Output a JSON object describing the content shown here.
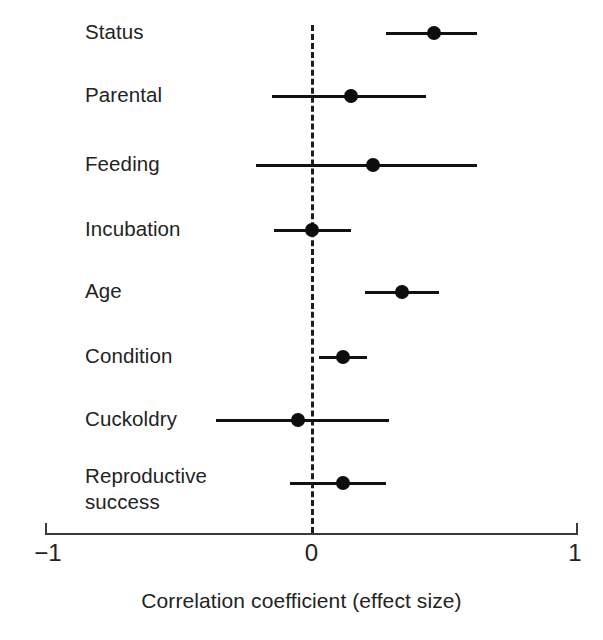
{
  "chart_data": {
    "type": "scatter",
    "plot_style": "forest-plot",
    "title": "",
    "xlabel": "Correlation coefficient (effect size)",
    "ylabel": "",
    "xlim": [
      -1,
      1
    ],
    "xticks": [
      -1,
      0,
      1
    ],
    "xticklabels": [
      "−1",
      "0",
      "1"
    ],
    "grid": false,
    "legend": false,
    "reference_line": {
      "x": 0,
      "style": "dashed"
    },
    "categories": [
      "Status",
      "Parental",
      "Feeding",
      "Incubation",
      "Age",
      "Condition",
      "Cuckoldry",
      "Reproductive\nsuccess"
    ],
    "values": [
      0.46,
      0.15,
      0.23,
      0.0,
      0.34,
      0.12,
      -0.05,
      0.12
    ],
    "ci_low": [
      0.28,
      -0.15,
      -0.21,
      -0.14,
      0.2,
      0.03,
      -0.36,
      -0.08
    ],
    "ci_high": [
      0.62,
      0.43,
      0.62,
      0.15,
      0.48,
      0.21,
      0.29,
      0.28
    ],
    "points": [
      {
        "label": "Status",
        "value": 0.46,
        "ci_low": 0.28,
        "ci_high": 0.62,
        "y": 33
      },
      {
        "label": "Parental",
        "value": 0.15,
        "ci_low": -0.15,
        "ci_high": 0.43,
        "y": 96
      },
      {
        "label": "Feeding",
        "value": 0.23,
        "ci_low": -0.21,
        "ci_high": 0.62,
        "y": 165
      },
      {
        "label": "Incubation",
        "value": 0.0,
        "ci_low": -0.14,
        "ci_high": 0.15,
        "y": 230
      },
      {
        "label": "Age",
        "value": 0.34,
        "ci_low": 0.2,
        "ci_high": 0.48,
        "y": 292
      },
      {
        "label": "Condition",
        "value": 0.12,
        "ci_low": 0.03,
        "ci_high": 0.21,
        "y": 357
      },
      {
        "label": "Cuckoldry",
        "value": -0.05,
        "ci_low": -0.36,
        "ci_high": 0.29,
        "y": 420
      },
      {
        "label": "Reproductive\nsuccess",
        "value": 0.12,
        "ci_low": -0.08,
        "ci_high": 0.28,
        "y": 483
      }
    ]
  },
  "axis": {
    "title": "Correlation coefficient (effect size)",
    "tick_left": "−1",
    "tick_center": "0",
    "tick_right": "1"
  },
  "colors": {
    "marker": "#0d0d0d",
    "line": "#111111",
    "axis": "#3a3a3a",
    "text": "#232323",
    "background": "#ffffff"
  }
}
